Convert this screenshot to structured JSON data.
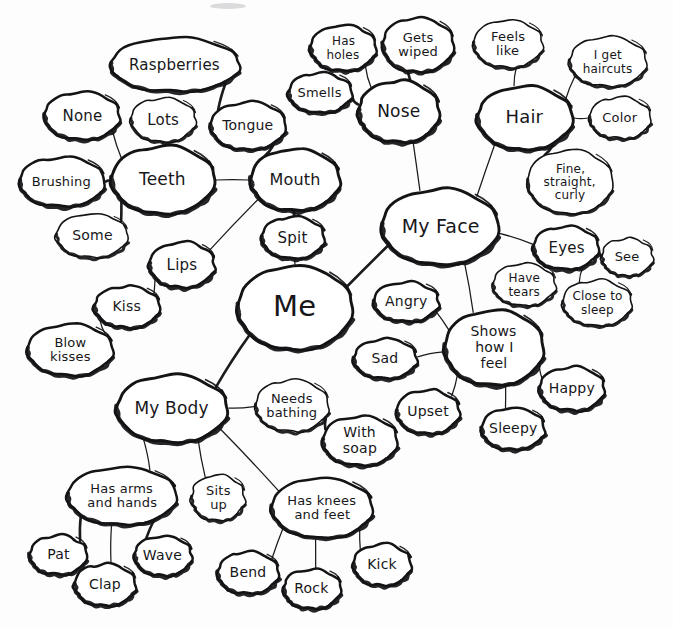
{
  "diagram": {
    "title": "Me",
    "type": "hand-drawn mind map",
    "style": {
      "ink_color": "#141417",
      "paper_color": "#fdfdfd",
      "text_color": "#17171a"
    },
    "nodes": [
      {
        "id": "me",
        "label": "Me",
        "cx": 295,
        "cy": 308,
        "rx": 58,
        "ry": 42,
        "font": 29,
        "weight": "hub",
        "lines": [
          "Me"
        ]
      },
      {
        "id": "my-face",
        "label": "My Face",
        "cx": 440,
        "cy": 227,
        "rx": 59,
        "ry": 38,
        "font": 19,
        "weight": "hub",
        "lines": [
          "My Face"
        ]
      },
      {
        "id": "my-body",
        "label": "My Body",
        "cx": 172,
        "cy": 409,
        "rx": 56,
        "ry": 34,
        "font": 17,
        "weight": "hub",
        "lines": [
          "My Body"
        ]
      },
      {
        "id": "mouth",
        "label": "Mouth",
        "cx": 295,
        "cy": 180,
        "rx": 45,
        "ry": 31,
        "font": 16,
        "weight": "hub",
        "lines": [
          "Mouth"
        ]
      },
      {
        "id": "teeth",
        "label": "Teeth",
        "cx": 163,
        "cy": 180,
        "rx": 52,
        "ry": 34,
        "font": 17,
        "weight": "hub",
        "lines": [
          "Teeth"
        ]
      },
      {
        "id": "nose",
        "label": "Nose",
        "cx": 399,
        "cy": 112,
        "rx": 41,
        "ry": 31,
        "font": 17,
        "weight": "hub",
        "lines": [
          "Nose"
        ]
      },
      {
        "id": "hair",
        "label": "Hair",
        "cx": 525,
        "cy": 118,
        "rx": 48,
        "ry": 32,
        "font": 18,
        "weight": "hub",
        "lines": [
          "Hair"
        ]
      },
      {
        "id": "shows-how-i-feel",
        "label": "Shows how I feel",
        "cx": 494,
        "cy": 348,
        "rx": 50,
        "ry": 38,
        "font": 14,
        "weight": "hub",
        "lines": [
          "Shows",
          "how I",
          "feel"
        ]
      },
      {
        "id": "raspberries",
        "label": "Raspberries",
        "cx": 175,
        "cy": 65,
        "rx": 65,
        "ry": 27,
        "font": 15,
        "weight": "bold",
        "lines": [
          "Raspberries"
        ]
      },
      {
        "id": "none",
        "label": "None",
        "cx": 82,
        "cy": 116,
        "rx": 38,
        "ry": 24,
        "font": 15,
        "weight": "bold",
        "lines": [
          "None"
        ]
      },
      {
        "id": "lots",
        "label": "Lots",
        "cx": 163,
        "cy": 120,
        "rx": 33,
        "ry": 22,
        "font": 15,
        "weight": "normal",
        "lines": [
          "Lots"
        ]
      },
      {
        "id": "tongue",
        "label": "Tongue",
        "cx": 248,
        "cy": 126,
        "rx": 38,
        "ry": 24,
        "font": 14,
        "weight": "bold",
        "lines": [
          "Tongue"
        ]
      },
      {
        "id": "brushing",
        "label": "Brushing",
        "cx": 62,
        "cy": 182,
        "rx": 43,
        "ry": 25,
        "font": 13,
        "weight": "bold",
        "lines": [
          "Brushing"
        ]
      },
      {
        "id": "some",
        "label": "Some",
        "cx": 92,
        "cy": 236,
        "rx": 36,
        "ry": 22,
        "font": 14,
        "weight": "normal",
        "lines": [
          "Some"
        ]
      },
      {
        "id": "spit",
        "label": "Spit",
        "cx": 293,
        "cy": 238,
        "rx": 32,
        "ry": 21,
        "font": 15,
        "weight": "bold",
        "lines": [
          "Spit"
        ]
      },
      {
        "id": "lips",
        "label": "Lips",
        "cx": 182,
        "cy": 265,
        "rx": 33,
        "ry": 23,
        "font": 15,
        "weight": "bold",
        "lines": [
          "Lips"
        ]
      },
      {
        "id": "kiss",
        "label": "Kiss",
        "cx": 127,
        "cy": 307,
        "rx": 33,
        "ry": 21,
        "font": 14,
        "weight": "bold",
        "lines": [
          "Kiss"
        ]
      },
      {
        "id": "blow-kisses",
        "label": "Blow kisses",
        "cx": 70,
        "cy": 350,
        "rx": 43,
        "ry": 26,
        "font": 13,
        "weight": "bold",
        "lines": [
          "Blow",
          "kisses"
        ]
      },
      {
        "id": "has-holes",
        "label": "Has holes",
        "cx": 343,
        "cy": 48,
        "rx": 33,
        "ry": 23,
        "font": 12,
        "weight": "bold",
        "lines": [
          "Has",
          "holes"
        ]
      },
      {
        "id": "gets-wiped",
        "label": "Gets wiped",
        "cx": 418,
        "cy": 45,
        "rx": 36,
        "ry": 27,
        "font": 13,
        "weight": "bold",
        "lines": [
          "Gets",
          "wiped"
        ]
      },
      {
        "id": "smells",
        "label": "Smells",
        "cx": 320,
        "cy": 93,
        "rx": 32,
        "ry": 20,
        "font": 13,
        "weight": "bold",
        "lines": [
          "Smells"
        ]
      },
      {
        "id": "feels-like",
        "label": "Feels like",
        "cx": 508,
        "cy": 44,
        "rx": 35,
        "ry": 24,
        "font": 13,
        "weight": "normal",
        "lines": [
          "Feels",
          "like"
        ]
      },
      {
        "id": "i-get-haircuts",
        "label": "I get haircuts",
        "cx": 608,
        "cy": 62,
        "rx": 39,
        "ry": 25,
        "font": 12,
        "weight": "normal",
        "lines": [
          "I get",
          "haircuts"
        ]
      },
      {
        "id": "color",
        "label": "Color",
        "cx": 620,
        "cy": 118,
        "rx": 31,
        "ry": 21,
        "font": 13,
        "weight": "normal",
        "lines": [
          "Color"
        ]
      },
      {
        "id": "fine-straight-curly",
        "label": "Fine, straight, curly",
        "cx": 570,
        "cy": 182,
        "rx": 43,
        "ry": 32,
        "font": 12,
        "weight": "normal",
        "lines": [
          "Fine,",
          "straight,",
          "curly"
        ]
      },
      {
        "id": "eyes",
        "label": "Eyes",
        "cx": 566,
        "cy": 248,
        "rx": 33,
        "ry": 22,
        "font": 15,
        "weight": "bold",
        "lines": [
          "Eyes"
        ]
      },
      {
        "id": "see",
        "label": "See",
        "cx": 627,
        "cy": 257,
        "rx": 26,
        "ry": 19,
        "font": 13,
        "weight": "normal",
        "lines": [
          "See"
        ]
      },
      {
        "id": "have-tears",
        "label": "Have tears",
        "cx": 524,
        "cy": 285,
        "rx": 32,
        "ry": 21,
        "font": 12,
        "weight": "normal",
        "lines": [
          "Have",
          "tears"
        ]
      },
      {
        "id": "close-to-sleep",
        "label": "Close to sleep",
        "cx": 597,
        "cy": 303,
        "rx": 35,
        "ry": 23,
        "font": 12,
        "weight": "normal",
        "lines": [
          "Close to",
          "sleep"
        ]
      },
      {
        "id": "angry",
        "label": "Angry",
        "cx": 406,
        "cy": 302,
        "rx": 33,
        "ry": 20,
        "font": 14,
        "weight": "bold",
        "lines": [
          "Angry"
        ]
      },
      {
        "id": "sad",
        "label": "Sad",
        "cx": 385,
        "cy": 359,
        "rx": 32,
        "ry": 20,
        "font": 14,
        "weight": "bold",
        "lines": [
          "Sad"
        ]
      },
      {
        "id": "upset",
        "label": "Upset",
        "cx": 428,
        "cy": 412,
        "rx": 32,
        "ry": 22,
        "font": 14,
        "weight": "bold",
        "lines": [
          "Upset"
        ]
      },
      {
        "id": "sleepy",
        "label": "Sleepy",
        "cx": 513,
        "cy": 429,
        "rx": 32,
        "ry": 21,
        "font": 14,
        "weight": "bold",
        "lines": [
          "Sleepy"
        ]
      },
      {
        "id": "happy",
        "label": "Happy",
        "cx": 572,
        "cy": 389,
        "rx": 33,
        "ry": 22,
        "font": 14,
        "weight": "bold",
        "lines": [
          "Happy"
        ]
      },
      {
        "id": "needs-bathing",
        "label": "Needs bathing",
        "cx": 292,
        "cy": 406,
        "rx": 37,
        "ry": 26,
        "font": 13,
        "weight": "normal",
        "lines": [
          "Needs",
          "bathing"
        ]
      },
      {
        "id": "with-soap",
        "label": "With soap",
        "cx": 360,
        "cy": 441,
        "rx": 38,
        "ry": 25,
        "font": 14,
        "weight": "bold",
        "lines": [
          "With",
          "soap"
        ]
      },
      {
        "id": "has-arms-and-hands",
        "label": "Has arms and hands",
        "cx": 122,
        "cy": 496,
        "rx": 55,
        "ry": 29,
        "font": 13,
        "weight": "bold",
        "lines": [
          "Has arms",
          "and hands"
        ]
      },
      {
        "id": "sits-up",
        "label": "Sits up",
        "cx": 218,
        "cy": 498,
        "rx": 27,
        "ry": 23,
        "font": 13,
        "weight": "normal",
        "lines": [
          "Sits",
          "up"
        ]
      },
      {
        "id": "has-knees-and-feet",
        "label": "Has knees and feet",
        "cx": 322,
        "cy": 508,
        "rx": 51,
        "ry": 30,
        "font": 13,
        "weight": "bold",
        "lines": [
          "Has knees",
          "and feet"
        ]
      },
      {
        "id": "pat",
        "label": "Pat",
        "cx": 58,
        "cy": 555,
        "rx": 29,
        "ry": 20,
        "font": 14,
        "weight": "bold",
        "lines": [
          "Pat"
        ]
      },
      {
        "id": "clap",
        "label": "Clap",
        "cx": 105,
        "cy": 585,
        "rx": 31,
        "ry": 21,
        "font": 14,
        "weight": "bold",
        "lines": [
          "Clap"
        ]
      },
      {
        "id": "wave",
        "label": "Wave",
        "cx": 163,
        "cy": 556,
        "rx": 29,
        "ry": 20,
        "font": 14,
        "weight": "bold",
        "lines": [
          "Wave"
        ]
      },
      {
        "id": "bend",
        "label": "Bend",
        "cx": 248,
        "cy": 573,
        "rx": 31,
        "ry": 21,
        "font": 14,
        "weight": "bold",
        "lines": [
          "Bend"
        ]
      },
      {
        "id": "rock",
        "label": "Rock",
        "cx": 312,
        "cy": 589,
        "rx": 29,
        "ry": 20,
        "font": 14,
        "weight": "bold",
        "lines": [
          "Rock"
        ]
      },
      {
        "id": "kick",
        "label": "Kick",
        "cx": 382,
        "cy": 565,
        "rx": 29,
        "ry": 21,
        "font": 14,
        "weight": "bold",
        "lines": [
          "Kick"
        ]
      }
    ],
    "edges": [
      {
        "from": "me",
        "to": "my-face",
        "thick": true
      },
      {
        "from": "me",
        "to": "my-body",
        "thick": true
      },
      {
        "from": "me",
        "to": "mouth",
        "thick": false
      },
      {
        "from": "mouth",
        "to": "teeth",
        "thick": false
      },
      {
        "from": "mouth",
        "to": "tongue",
        "thick": true
      },
      {
        "from": "mouth",
        "to": "spit",
        "thick": true
      },
      {
        "from": "mouth",
        "to": "lips",
        "thick": false
      },
      {
        "from": "tongue",
        "to": "raspberries",
        "thick": true
      },
      {
        "from": "teeth",
        "to": "none",
        "thick": false
      },
      {
        "from": "teeth",
        "to": "lots",
        "thick": false
      },
      {
        "from": "teeth",
        "to": "brushing",
        "thick": true
      },
      {
        "from": "teeth",
        "to": "some",
        "thick": true
      },
      {
        "from": "lips",
        "to": "kiss",
        "thick": false
      },
      {
        "from": "kiss",
        "to": "blow-kisses",
        "thick": false
      },
      {
        "from": "my-face",
        "to": "nose",
        "thick": false
      },
      {
        "from": "my-face",
        "to": "hair",
        "thick": false
      },
      {
        "from": "my-face",
        "to": "eyes",
        "thick": false
      },
      {
        "from": "my-face",
        "to": "shows-how-i-feel",
        "thick": false
      },
      {
        "from": "nose",
        "to": "has-holes",
        "thick": false
      },
      {
        "from": "nose",
        "to": "gets-wiped",
        "thick": true
      },
      {
        "from": "nose",
        "to": "smells",
        "thick": true
      },
      {
        "from": "hair",
        "to": "feels-like",
        "thick": false
      },
      {
        "from": "hair",
        "to": "i-get-haircuts",
        "thick": false
      },
      {
        "from": "hair",
        "to": "color",
        "thick": false
      },
      {
        "from": "hair",
        "to": "fine-straight-curly",
        "thick": true
      },
      {
        "from": "eyes",
        "to": "see",
        "thick": false
      },
      {
        "from": "eyes",
        "to": "close-to-sleep",
        "thick": false
      },
      {
        "from": "shows-how-i-feel",
        "to": "angry",
        "thick": false
      },
      {
        "from": "shows-how-i-feel",
        "to": "sad",
        "thick": false
      },
      {
        "from": "shows-how-i-feel",
        "to": "upset",
        "thick": false
      },
      {
        "from": "shows-how-i-feel",
        "to": "sleepy",
        "thick": false
      },
      {
        "from": "shows-how-i-feel",
        "to": "happy",
        "thick": false
      },
      {
        "from": "my-body",
        "to": "needs-bathing",
        "thick": false
      },
      {
        "from": "needs-bathing",
        "to": "with-soap",
        "thick": true
      },
      {
        "from": "my-body",
        "to": "has-arms-and-hands",
        "thick": false
      },
      {
        "from": "my-body",
        "to": "sits-up",
        "thick": false
      },
      {
        "from": "my-body",
        "to": "has-knees-and-feet",
        "thick": false
      },
      {
        "from": "has-arms-and-hands",
        "to": "pat",
        "thick": true
      },
      {
        "from": "has-arms-and-hands",
        "to": "clap",
        "thick": false
      },
      {
        "from": "has-arms-and-hands",
        "to": "wave",
        "thick": true
      },
      {
        "from": "has-knees-and-feet",
        "to": "bend",
        "thick": false
      },
      {
        "from": "has-knees-and-feet",
        "to": "rock",
        "thick": false
      },
      {
        "from": "has-knees-and-feet",
        "to": "kick",
        "thick": false
      }
    ]
  }
}
